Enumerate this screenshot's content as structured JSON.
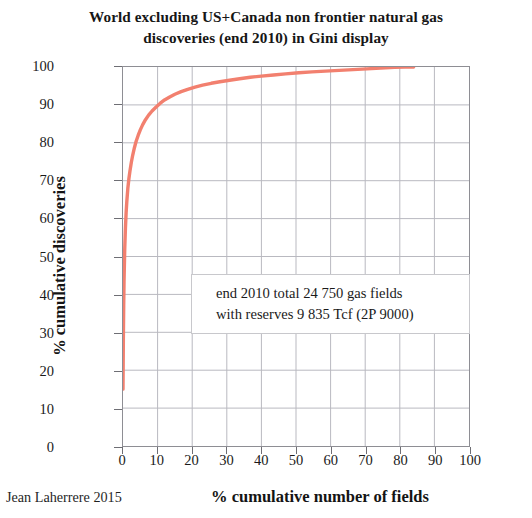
{
  "title": {
    "line1": "World excluding US+Canada non frontier natural gas",
    "line2": "discoveries (end 2010) in Gini display"
  },
  "credit": "Jean Laherrere 2015",
  "annotation": {
    "line1": "end 2010 total  24 750 gas fields",
    "line2": "with reserves  9 835 Tcf (2P 9000)"
  },
  "axes": {
    "x_label": "% cumulative number of fields",
    "y_label": "% cumulative discoveries",
    "x_ticks": [
      "0",
      "10",
      "20",
      "30",
      "40",
      "50",
      "60",
      "70",
      "80",
      "90",
      "100"
    ],
    "y_ticks": [
      "0",
      "10",
      "20",
      "30",
      "40",
      "50",
      "60",
      "70",
      "80",
      "90",
      "100"
    ]
  },
  "colors": {
    "curve": "#F2806F",
    "grid": "#b9b9c0",
    "frame": "#8e8e94",
    "text": "#1a1a1a"
  },
  "chart_data": {
    "type": "line",
    "title": "World excluding US+Canada non frontier natural gas discoveries (end 2010) in Gini display",
    "xlabel": "% cumulative number of fields",
    "ylabel": "% cumulative discoveries",
    "xlim": [
      0,
      100
    ],
    "ylim": [
      0,
      100
    ],
    "grid": true,
    "legend": null,
    "annotations": [
      "end 2010 total  24 750 gas fields",
      "with reserves  9 835 Tcf (2P 9000)"
    ],
    "series": [
      {
        "name": "cumulative gas discoveries (Gini / Lorenz curve)",
        "color": "#F2806F",
        "x": [
          0.0,
          0.1,
          0.2,
          0.3,
          0.5,
          0.7,
          0.9,
          1.1,
          1.4,
          1.7,
          2.0,
          2.4,
          2.8,
          3.3,
          3.8,
          4.4,
          5.0,
          5.7,
          6.5,
          7.4,
          8.4,
          9.5,
          10.7,
          12.0,
          13.5,
          15.0,
          16.8,
          18.7,
          20.8,
          23.0,
          25.5,
          28.0,
          30.8,
          33.7,
          36.8,
          40.0,
          43.5,
          47.0,
          50.8,
          54.6,
          58.5,
          62.5,
          66.5,
          70.5,
          74.5,
          78.5,
          81.5,
          84.0
        ],
        "y": [
          15.0,
          28.0,
          37.0,
          43.5,
          52.0,
          57.5,
          61.5,
          64.5,
          68.0,
          70.5,
          72.5,
          74.8,
          76.7,
          78.7,
          80.4,
          82.0,
          83.4,
          84.8,
          86.1,
          87.3,
          88.4,
          89.4,
          90.4,
          91.3,
          92.1,
          92.8,
          93.5,
          94.1,
          94.7,
          95.2,
          95.7,
          96.1,
          96.5,
          96.9,
          97.3,
          97.6,
          97.9,
          98.2,
          98.5,
          98.7,
          98.9,
          99.1,
          99.3,
          99.5,
          99.7,
          99.9,
          100.0,
          100.0
        ]
      }
    ]
  }
}
